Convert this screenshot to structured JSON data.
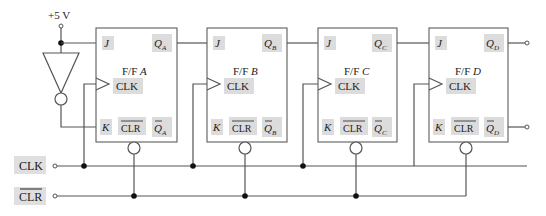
{
  "supply": {
    "label": "+5 V"
  },
  "inputs": {
    "clk_label": "CLK",
    "clr_label": "CLR"
  },
  "flipflops": [
    {
      "name": "F/F",
      "id": "A",
      "j": "J",
      "k": "K",
      "clk": "CLK",
      "clr": "CLR",
      "q": "Q",
      "qbar": "Q",
      "sub": "A"
    },
    {
      "name": "F/F",
      "id": "B",
      "j": "J",
      "k": "K",
      "clk": "CLK",
      "clr": "CLR",
      "q": "Q",
      "qbar": "Q",
      "sub": "B"
    },
    {
      "name": "F/F",
      "id": "C",
      "j": "J",
      "k": "K",
      "clk": "CLK",
      "clr": "CLR",
      "q": "Q",
      "qbar": "Q",
      "sub": "C"
    },
    {
      "name": "F/F",
      "id": "D",
      "j": "J",
      "k": "K",
      "clk": "CLK",
      "clr": "CLR",
      "q": "Q",
      "qbar": "Q",
      "sub": "D"
    }
  ],
  "colors": {
    "wire": "#555555",
    "label_bg": "#dcdcdc",
    "text": "#222222"
  }
}
